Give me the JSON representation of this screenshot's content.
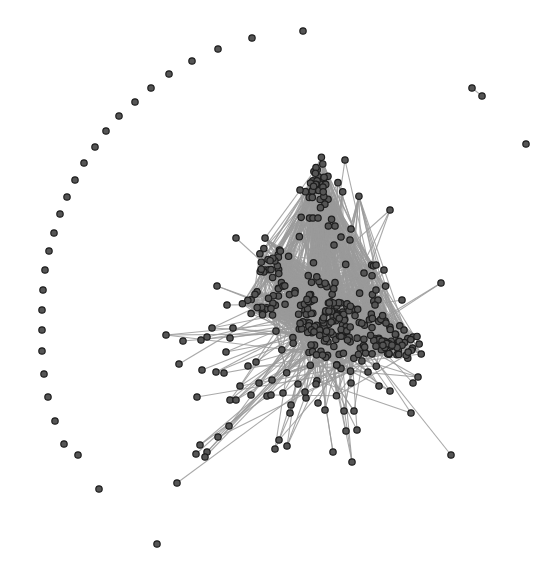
{
  "graph": {
    "type": "network",
    "layout": "force-directed",
    "canvas": {
      "width": 540,
      "height": 568,
      "background": "#ffffff"
    },
    "style": {
      "node_fill": "#555555",
      "node_stroke": "#1e1e1e",
      "node_radius": 3.2,
      "edge_color": "#9a9a9a"
    },
    "isolated_nodes": [
      [
        303,
        31
      ],
      [
        252,
        38
      ],
      [
        218,
        49
      ],
      [
        192,
        61
      ],
      [
        169,
        74
      ],
      [
        151,
        88
      ],
      [
        135,
        102
      ],
      [
        119,
        116
      ],
      [
        106,
        131
      ],
      [
        95,
        147
      ],
      [
        84,
        163
      ],
      [
        75,
        180
      ],
      [
        67,
        197
      ],
      [
        60,
        214
      ],
      [
        54,
        233
      ],
      [
        49,
        251
      ],
      [
        45,
        270
      ],
      [
        43,
        290
      ],
      [
        42,
        310
      ],
      [
        42,
        330
      ],
      [
        42,
        351
      ],
      [
        44,
        374
      ],
      [
        48,
        397
      ],
      [
        55,
        421
      ],
      [
        64,
        444
      ],
      [
        78,
        455
      ],
      [
        99,
        489
      ],
      [
        157,
        544
      ],
      [
        526,
        144
      ]
    ],
    "pair_component": {
      "nodes": [
        [
          472,
          88
        ],
        [
          482,
          96
        ]
      ],
      "edges": [
        [
          0,
          1
        ]
      ]
    },
    "main_component": {
      "clusters": [
        {
          "name": "top-cluster",
          "center": [
            320,
            190
          ],
          "spread": [
            10,
            16
          ],
          "count": 40
        },
        {
          "name": "left-cluster",
          "center": [
            272,
            268
          ],
          "spread": [
            10,
            12
          ],
          "count": 28
        },
        {
          "name": "core-cluster",
          "center": [
            330,
            322
          ],
          "spread": [
            24,
            24
          ],
          "count": 160
        },
        {
          "name": "right-cluster",
          "center": [
            392,
            342
          ],
          "spread": [
            16,
            10
          ],
          "count": 55
        },
        {
          "name": "mid-left-cluster",
          "center": [
            262,
            305
          ],
          "spread": [
            10,
            8
          ],
          "count": 18
        }
      ],
      "peripheral_nodes": [
        [
          345,
          160
        ],
        [
          390,
          210
        ],
        [
          236,
          238
        ],
        [
          300,
          190
        ],
        [
          313,
          218
        ],
        [
          318,
          218
        ],
        [
          335,
          226
        ],
        [
          351,
          229
        ],
        [
          350,
          240
        ],
        [
          334,
          245
        ],
        [
          341,
          237
        ],
        [
          217,
          286
        ],
        [
          227,
          305
        ],
        [
          166,
          335
        ],
        [
          212,
          328
        ],
        [
          233,
          328
        ],
        [
          207,
          337
        ],
        [
          230,
          338
        ],
        [
          183,
          341
        ],
        [
          201,
          340
        ],
        [
          179,
          364
        ],
        [
          202,
          370
        ],
        [
          216,
          372
        ],
        [
          224,
          373
        ],
        [
          226,
          352
        ],
        [
          248,
          366
        ],
        [
          256,
          362
        ],
        [
          251,
          395
        ],
        [
          267,
          396
        ],
        [
          230,
          400
        ],
        [
          197,
          397
        ],
        [
          229,
          426
        ],
        [
          218,
          437
        ],
        [
          200,
          445
        ],
        [
          196,
          454
        ],
        [
          207,
          452
        ],
        [
          205,
          457
        ],
        [
          177,
          483
        ],
        [
          236,
          400
        ],
        [
          240,
          386
        ],
        [
          259,
          383
        ],
        [
          272,
          380
        ],
        [
          271,
          395
        ],
        [
          441,
          283
        ],
        [
          376,
          265
        ],
        [
          384,
          270
        ],
        [
          376,
          290
        ],
        [
          378,
          300
        ],
        [
          402,
          300
        ],
        [
          364,
          273
        ],
        [
          375,
          305
        ],
        [
          386,
          323
        ],
        [
          404,
          330
        ],
        [
          418,
          377
        ],
        [
          413,
          383
        ],
        [
          390,
          391
        ],
        [
          368,
          372
        ],
        [
          351,
          383
        ],
        [
          379,
          386
        ],
        [
          354,
          411
        ],
        [
          346,
          431
        ],
        [
          357,
          430
        ],
        [
          344,
          411
        ],
        [
          325,
          410
        ],
        [
          318,
          403
        ],
        [
          306,
          398
        ],
        [
          283,
          393
        ],
        [
          290,
          413
        ],
        [
          279,
          440
        ],
        [
          287,
          446
        ],
        [
          275,
          449
        ],
        [
          333,
          452
        ],
        [
          352,
          462
        ],
        [
          411,
          413
        ],
        [
          451,
          455
        ],
        [
          316,
          384
        ],
        [
          305,
          392
        ],
        [
          291,
          405
        ],
        [
          298,
          384
        ]
      ],
      "random_seed": 7
    },
    "labels": []
  }
}
